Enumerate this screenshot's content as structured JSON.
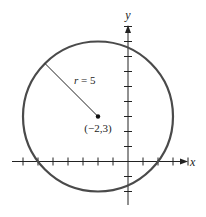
{
  "diagram": {
    "type": "circle-on-coordinate-plane",
    "axes": {
      "x_label": "x",
      "y_label": "y",
      "x_range": [
        -8,
        4
      ],
      "y_range": [
        -3,
        9
      ],
      "tick_interval": 1
    },
    "circle": {
      "center": [
        -2,
        3
      ],
      "radius": 5,
      "radius_label": "r = 5",
      "center_label": "(−2,3)",
      "stroke_color": "#4a4a4a"
    },
    "radius_segment_angle_deg": 135
  }
}
